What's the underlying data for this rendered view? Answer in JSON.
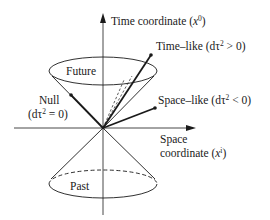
{
  "diagram": {
    "axes": {
      "time": {
        "label": "Time coordinate (",
        "var": "x",
        "sup": "0",
        "close": ")"
      },
      "space": {
        "label_line1": "Space",
        "label_line2": "coordinate (",
        "var": "x",
        "sup": "i",
        "close": ")"
      }
    },
    "regions": {
      "future": "Future",
      "past": "Past"
    },
    "vectors": {
      "time_like": {
        "label": "Time–like (dτ",
        "sup": "2",
        "rest": " > 0)"
      },
      "space_like": {
        "label": "Space–like (dτ",
        "sup": "2",
        "rest": " < 0)"
      },
      "null": {
        "label_line1": "Null",
        "label_line2": "(dτ",
        "sup": "2",
        "rest": " = 0)"
      }
    },
    "colors": {
      "ink": "#1a1a1a",
      "background": "#ffffff"
    }
  }
}
